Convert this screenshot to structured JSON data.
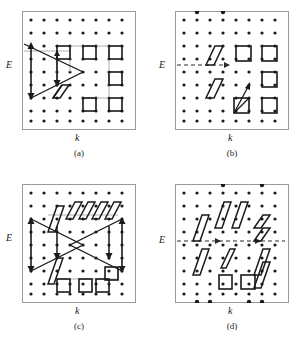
{
  "figure": {
    "type": "scientific-diagram",
    "background_color": "#ffffff",
    "dot_color": "#1a1a1a",
    "frame_color": "#9a9a9a",
    "arrow_color": "#1a1a1a",
    "link_color": "#b0b0b0",
    "dashed_color": "#2a2a2a"
  },
  "panels": [
    {
      "id": "a",
      "caption": "(a)",
      "x_axis_label": "k",
      "y_axis_label": "E",
      "grid": {
        "cols": 9,
        "rows": 9,
        "spacing": 13
      },
      "fermi_line": {
        "visible": false,
        "style": "none"
      },
      "boundary_dots": [],
      "shapes": [
        {
          "kind": "triangle-arrows",
          "count": 1,
          "region": "left-middle"
        },
        {
          "kind": "parallelogram",
          "count": 1,
          "region": "lower-center-left"
        },
        {
          "kind": "square",
          "count": 5,
          "region": "right"
        }
      ]
    },
    {
      "id": "b",
      "caption": "(b)",
      "x_axis_label": "k",
      "y_axis_label": "E",
      "grid": {
        "cols": 9,
        "rows": 9,
        "spacing": 13
      },
      "fermi_line": {
        "visible": true,
        "style": "dashed-arrow"
      },
      "boundary_dots": [
        "top-col-2",
        "top-col-4"
      ],
      "shapes": [
        {
          "kind": "parallelogram",
          "count": 2,
          "region": "center-left"
        },
        {
          "kind": "square",
          "count": 5,
          "region": "right"
        },
        {
          "kind": "square-with-diagonal-arrow",
          "count": 1,
          "region": "lower-center"
        }
      ]
    },
    {
      "id": "c",
      "caption": "(c)",
      "x_axis_label": "k",
      "y_axis_label": "E",
      "grid": {
        "cols": 9,
        "rows": 9,
        "spacing": 13
      },
      "fermi_line": {
        "visible": false,
        "style": "none"
      },
      "boundary_dots": [],
      "shapes": [
        {
          "kind": "triangle-arrows",
          "count": 2,
          "region": "left-and-right-middle"
        },
        {
          "kind": "parallelogram",
          "count": 6,
          "region": "top-band-and-left"
        },
        {
          "kind": "square",
          "count": 4,
          "region": "bottom"
        }
      ]
    },
    {
      "id": "d",
      "caption": "(d)",
      "x_axis_label": "k",
      "y_axis_label": "E",
      "grid": {
        "cols": 9,
        "rows": 9,
        "spacing": 13
      },
      "fermi_line": {
        "visible": true,
        "style": "dashed-arrow"
      },
      "boundary_dots": [
        "top-col-3",
        "top-col-6",
        "bottom-col-2",
        "bottom-col-3",
        "bottom-col-6",
        "bottom-col-7"
      ],
      "shapes": [
        {
          "kind": "parallelogram",
          "count": 9,
          "region": "scattered"
        },
        {
          "kind": "square",
          "count": 2,
          "region": "lower-center"
        }
      ]
    }
  ]
}
